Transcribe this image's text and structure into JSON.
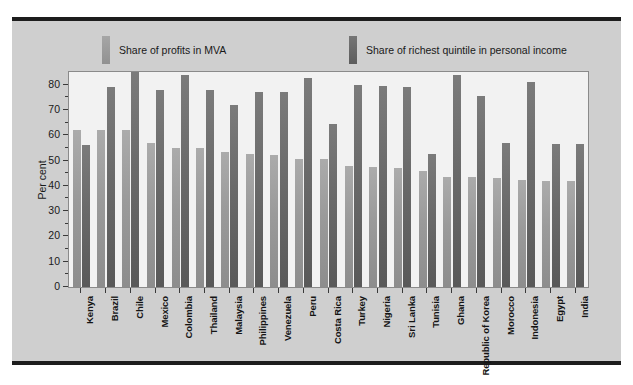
{
  "chart_data": {
    "type": "bar",
    "title": "",
    "subtitle": "",
    "xlabel": "",
    "ylabel": "Per cent",
    "ylim": [
      0,
      85
    ],
    "yticks": [
      0,
      10,
      20,
      30,
      40,
      50,
      60,
      70,
      80
    ],
    "grid": false,
    "legend_position": "top",
    "categories": [
      "Kenya",
      "Brazil",
      "Chile",
      "Mexico",
      "Colombia",
      "Thailand",
      "Malaysia",
      "Philippines",
      "Venezuela",
      "Peru",
      "Costa Rica",
      "Turkey",
      "Nigeria",
      "Sri Lanka",
      "Tunisia",
      "Ghana",
      "Republic of Korea",
      "Morocco",
      "Indonesia",
      "Egypt",
      "India"
    ],
    "series": [
      {
        "name": "Share of profits in MVA",
        "color": "#9a9a9a",
        "values": [
          62,
          62,
          62,
          57,
          55,
          55,
          53.5,
          52.5,
          52,
          50.5,
          50.5,
          48,
          47.5,
          47,
          46,
          43.5,
          43.5,
          43,
          42.5,
          42,
          42
        ]
      },
      {
        "name": "Share of richest quintile in personal income",
        "color": "#6a6a6a",
        "values": [
          56,
          79,
          85,
          78,
          84,
          78,
          72,
          77,
          77,
          82.5,
          64.5,
          80,
          79.5,
          79,
          52.5,
          84,
          75.5,
          57,
          81,
          56.5,
          56.5
        ]
      }
    ]
  },
  "legend": {
    "entries": [
      {
        "label": "Share of profits in MVA",
        "swatch": "light"
      },
      {
        "label": "Share of richest quintile in personal income",
        "swatch": "dark"
      }
    ]
  },
  "axes": {
    "y_axis_label": "Per cent",
    "y_tick_labels": [
      "0",
      "10",
      "20",
      "30",
      "40",
      "50",
      "60",
      "70",
      "80"
    ]
  }
}
